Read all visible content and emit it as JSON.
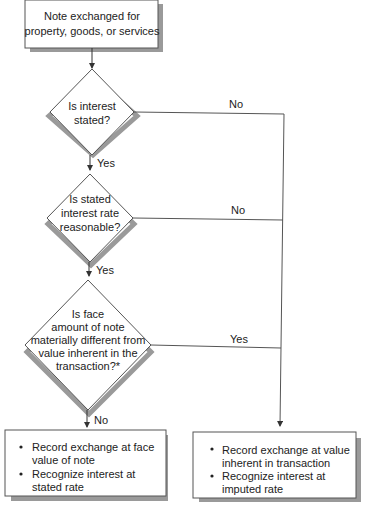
{
  "flowchart": {
    "start": {
      "lines": [
        "Note exchanged for",
        "property, goods, or services"
      ]
    },
    "decision1": {
      "lines": [
        "Is interest",
        "stated?"
      ],
      "yes_label": "Yes",
      "no_label": "No"
    },
    "decision2": {
      "lines": [
        "Is stated",
        "interest rate",
        "reasonable?"
      ],
      "yes_label": "Yes",
      "no_label": "No"
    },
    "decision3": {
      "lines": [
        "Is face",
        "amount of note",
        "materially different from",
        "value inherent in the",
        "transaction?*"
      ],
      "yes_label": "Yes",
      "no_label": "No"
    },
    "outcome_left": {
      "bullets": [
        [
          "Record exchange at face",
          "value of note"
        ],
        [
          "Recognize interest at",
          "stated rate"
        ]
      ]
    },
    "outcome_right": {
      "bullets": [
        [
          "Record exchange at value",
          "inherent in transaction"
        ],
        [
          "Recognize interest at",
          "imputed rate"
        ]
      ]
    }
  }
}
